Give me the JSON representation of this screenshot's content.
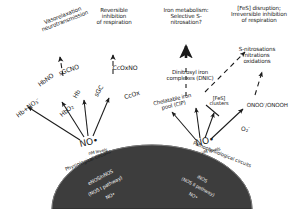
{
  "figure": {
    "colors": {
      "text": "#1b1b1b",
      "dome_fill": "#3a3a3a",
      "dome_text": "#efefef",
      "arrow": "#1b1b1b",
      "background": "#ffffff"
    }
  },
  "outcomes": {
    "vasorelaxation": "Vasorelaxation\nneurotransmission",
    "reversible_inhibition": "Reversible\ninhibition\nof respiration",
    "iron_metabolism": "Iron metabolism:\nSelective S-\nnitrosation?",
    "fes_disruption": "[FeS] disruption;\nIrreversible inhibition\nof respiration",
    "s_nitrosations": "S-nitrosations\nnitrations\noxidations"
  },
  "species": {
    "hb_no3": "Hb+NO",
    "hb_no3_sub": "3",
    "hb_no3_sup": "–",
    "hbno": "HbNO",
    "hbo2": "HbO",
    "hbo2_sub": "2",
    "hb": "Hb",
    "sgcno": "sGCNO",
    "sgc": "sGC",
    "ccoxno": "CcOxNO",
    "ccox": "CcOx",
    "chelatable_iron": "Chelatable iron\npool (CIP)",
    "dnic": "Dinitrosyl iron\ncomplexes (DNIC)",
    "fes_clusters": "[FeS]\nclusters",
    "onoo": "ONOO",
    "onoo_sup": "–",
    "onoo_tail": "/ONOOH",
    "superoxide": "O",
    "superoxide_sub": "2",
    "superoxide_sup": "–"
  },
  "nitric_oxide": {
    "left_label": "NO•",
    "left_level": "nM levels",
    "right_label": "NO•",
    "right_level": "µM levels"
  },
  "circuits": {
    "physiological": "Physiological circuits",
    "pathophysiological": "Pathophysiological circuits"
  },
  "dome": {
    "left_pathway_line1": "eNOS/nNOS",
    "left_pathway_line2": "(NOS I pathway)",
    "left_pathway_line3": "NO•",
    "right_pathway_line1": "iNOS",
    "right_pathway_line2": "(NOS II pathway)",
    "right_pathway_line3": "NO•"
  }
}
